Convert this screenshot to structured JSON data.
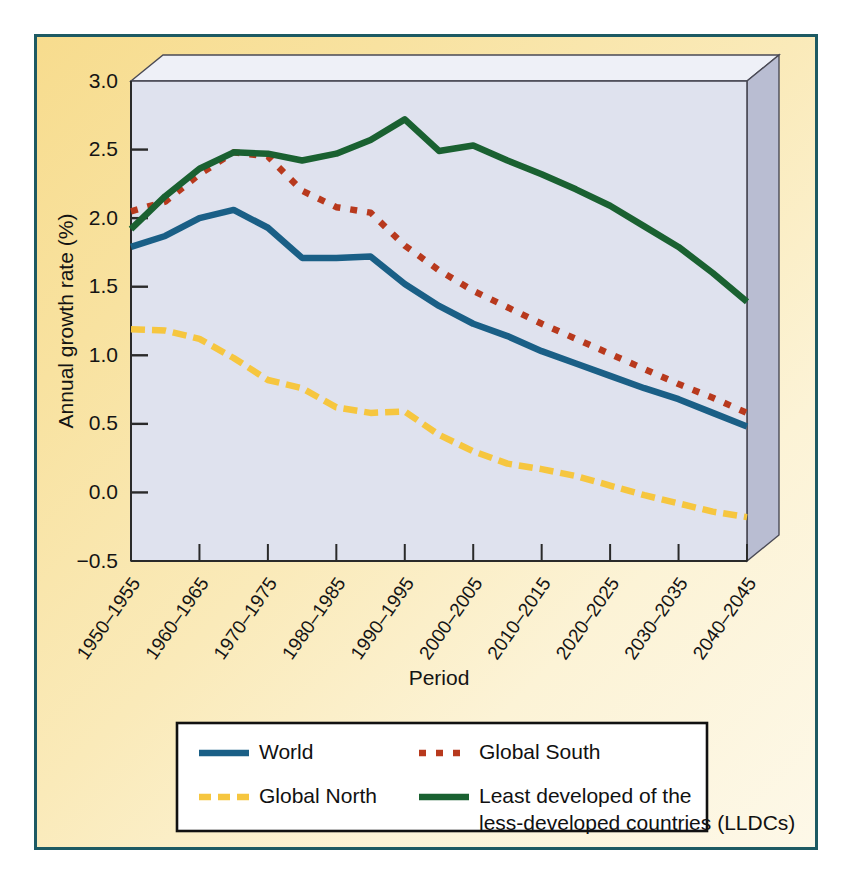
{
  "figure": {
    "border_color": "#1d5a63",
    "background_from": "#f7dc8e",
    "background_to": "#fdf8e8"
  },
  "chart_data": {
    "type": "line",
    "title": "",
    "xlabel": "Period",
    "ylabel": "Annual growth rate (%)",
    "ylim": [
      -0.5,
      3.0
    ],
    "ytick_values": [
      -0.5,
      0.0,
      0.5,
      1.0,
      1.5,
      2.0,
      2.5,
      3.0
    ],
    "ytick_labels": [
      "−0.5",
      "0.0",
      "0.5",
      "1.0",
      "1.5",
      "2.0",
      "2.5",
      "3.0"
    ],
    "grid": false,
    "legend_position": "below-axes",
    "plot_background": "#dfe2ee",
    "categories": [
      "1950–1955",
      "1955–1960",
      "1960–1965",
      "1965–1970",
      "1970–1975",
      "1975–1980",
      "1980–1985",
      "1985–1990",
      "1990–1995",
      "1995–2000",
      "2000–2005",
      "2005–2010",
      "2010–2015",
      "2015–2020",
      "2020–2025",
      "2025–2030",
      "2030–2035",
      "2035–2040",
      "2040–2045"
    ],
    "xtick_labels": [
      "1950–1955",
      "1960–1965",
      "1970–1975",
      "1980–1985",
      "1990–1995",
      "2000–2005",
      "2010–2015",
      "2020–2025",
      "2030–2035",
      "2040–2045"
    ],
    "series": [
      {
        "name": "World",
        "color": "#1a5f86",
        "style": "solid",
        "values": [
          1.79,
          1.87,
          2.0,
          2.06,
          1.93,
          1.71,
          1.71,
          1.72,
          1.52,
          1.36,
          1.23,
          1.14,
          1.03,
          0.94,
          0.85,
          0.76,
          0.68,
          0.58,
          0.48
        ]
      },
      {
        "name": "Global South",
        "color": "#b8391d",
        "style": "dotted",
        "values": [
          2.05,
          2.12,
          2.32,
          2.48,
          2.45,
          2.2,
          2.08,
          2.04,
          1.8,
          1.62,
          1.47,
          1.35,
          1.23,
          1.12,
          1.01,
          0.9,
          0.79,
          0.69,
          0.58
        ]
      },
      {
        "name": "Global North",
        "color": "#f6c63f",
        "style": "dashed",
        "values": [
          1.19,
          1.18,
          1.12,
          0.98,
          0.82,
          0.76,
          0.62,
          0.58,
          0.59,
          0.42,
          0.3,
          0.21,
          0.17,
          0.12,
          0.05,
          -0.02,
          -0.08,
          -0.14,
          -0.18
        ]
      },
      {
        "name": "Least developed of the less-developed countries (LLDCs)",
        "color": "#1a6131",
        "style": "solid",
        "values": [
          1.92,
          2.16,
          2.36,
          2.48,
          2.47,
          2.42,
          2.47,
          2.57,
          2.72,
          2.49,
          2.53,
          2.42,
          2.32,
          2.21,
          2.09,
          1.94,
          1.79,
          1.6,
          1.39
        ]
      }
    ]
  },
  "legend": {
    "entries": [
      {
        "label": "World",
        "color": "#1a5f86",
        "style": "solid"
      },
      {
        "label": "Global South",
        "color": "#b8391d",
        "style": "dotted"
      },
      {
        "label": "Global North",
        "color": "#f6c63f",
        "style": "dashed"
      },
      {
        "label": "Least developed of the",
        "label2": "less-developed countries (LLDCs)",
        "color": "#1a6131",
        "style": "solid"
      }
    ]
  }
}
